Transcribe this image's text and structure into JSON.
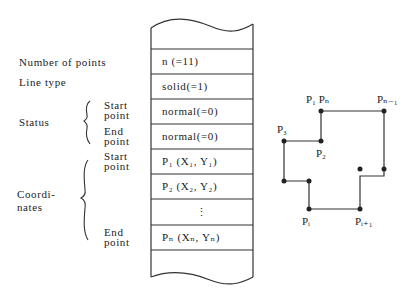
{
  "labels": {
    "number_of_points": "Number of points",
    "line_type": "Line type",
    "status": "Status",
    "status_start": "Start\npoint",
    "status_end": "End\npoint",
    "coordinates": "Coordi-\nnates",
    "coord_start": "Start\npoint",
    "coord_end": "End\npoint"
  },
  "table": {
    "rows": [
      "",
      "n (=11)",
      "solid(=1)",
      "normal(=0)",
      "normal(=0)",
      "P₁ (X₁, Y₁)",
      "P₂ (X₂, Y₂)",
      "⋮",
      "Pₙ (Xₙ, Yₙ)",
      ""
    ]
  },
  "polygon": {
    "point_labels": {
      "p1_pn": "P₁ Pₙ",
      "pn_minus_1": "Pₙ₋₁",
      "p3": "P₃",
      "p2": "P₂",
      "pi": "Pᵢ",
      "pi_plus_1": "Pᵢ₊₁"
    },
    "vertices": [
      [
        321,
        111
      ],
      [
        384,
        111
      ],
      [
        384,
        176
      ],
      [
        360,
        176
      ],
      [
        360,
        209
      ],
      [
        309,
        209
      ],
      [
        309,
        181
      ],
      [
        284,
        181
      ],
      [
        284,
        141
      ],
      [
        321,
        141
      ]
    ]
  }
}
